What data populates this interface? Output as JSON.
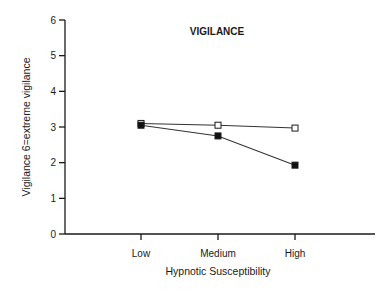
{
  "chart_data": {
    "type": "line",
    "title": "VIGILANCE",
    "xlabel": "Hypnotic Susceptibility",
    "ylabel": "Vigilance 6=extreme vigilance",
    "categories": [
      "Low",
      "Medium",
      "High"
    ],
    "ylim": [
      0,
      6
    ],
    "yticks": [
      "0",
      "1",
      "2",
      "3",
      "4",
      "5",
      "6"
    ],
    "grid": false,
    "legend": "none",
    "series": [
      {
        "name": "open-squares",
        "marker": "open-square",
        "values": [
          3.1,
          3.05,
          2.97
        ]
      },
      {
        "name": "filled-squares",
        "marker": "filled-square",
        "values": [
          3.05,
          2.75,
          1.93
        ]
      }
    ]
  },
  "colors": {
    "axis": "#1a1a1a",
    "line": "#333333",
    "marker_fill": "#111111",
    "open_marker_fill": "#ffffff"
  }
}
